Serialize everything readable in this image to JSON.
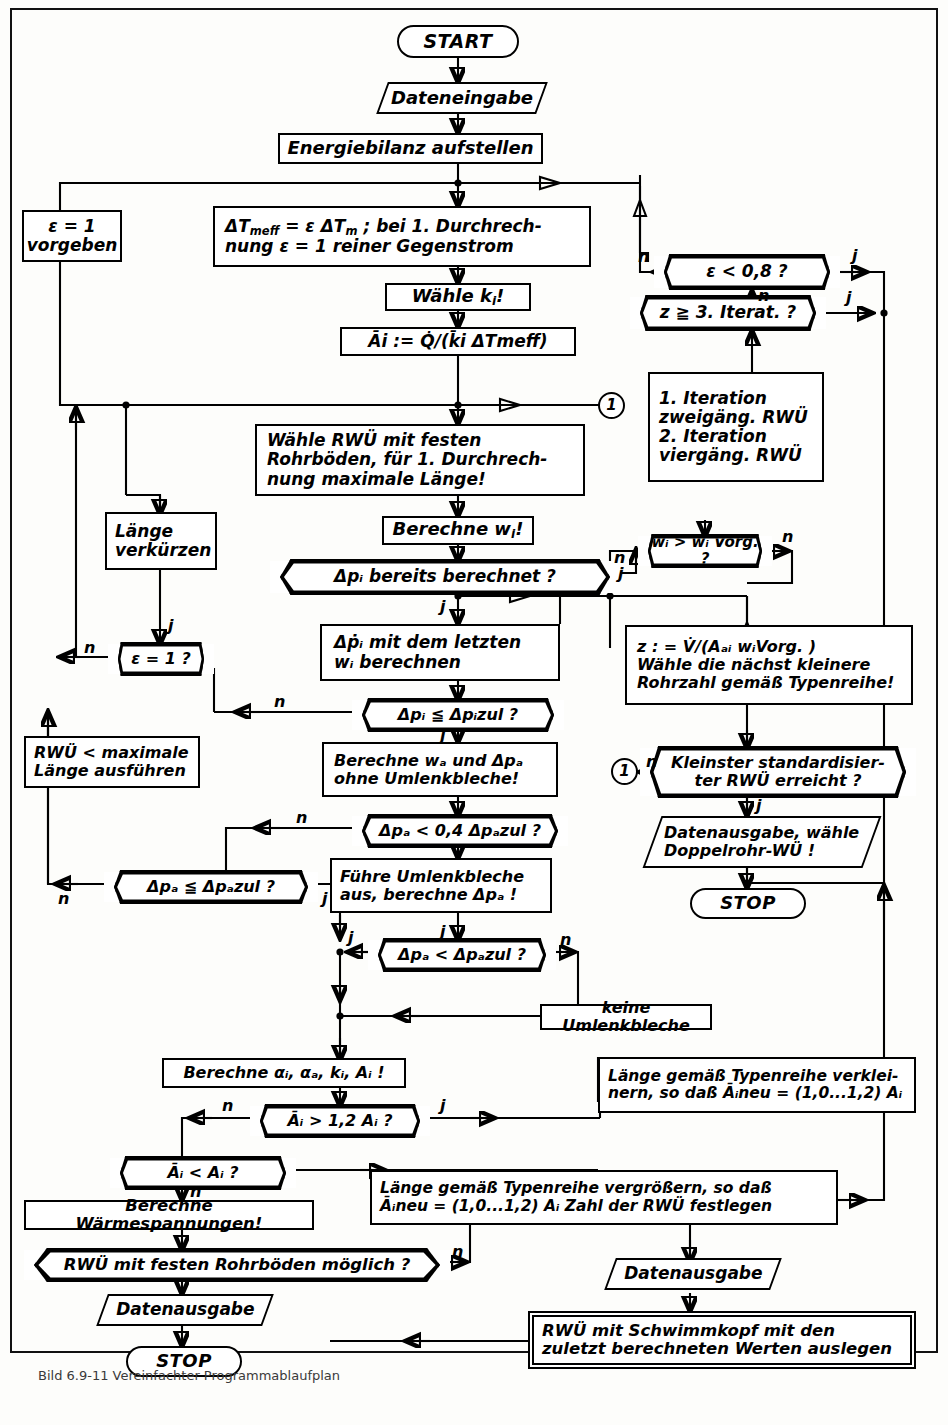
{
  "diagram": {
    "type": "flowchart",
    "language": "de",
    "colors": {
      "ink": "#000000",
      "paper": "#fdfdfb",
      "frame": "#111111"
    },
    "branch_labels": {
      "yes": "j",
      "no": "n"
    }
  },
  "nodes": {
    "start": {
      "label": "START",
      "shape": "terminator"
    },
    "dateneingabe": {
      "label": "Dateneingabe",
      "shape": "io"
    },
    "energiebilanz": {
      "label": "Energiebilanz aufstellen",
      "shape": "process"
    },
    "eps_vorgeben": {
      "line1": "ε = 1",
      "line2": "vorgeben",
      "shape": "process"
    },
    "dtmeff": {
      "line1": "ΔT",
      "sub1": "meff",
      "rest1": " = ε ΔT",
      "sub2": "m",
      "rest2": " ; bei 1. Durchrech-",
      "line2": "nung ε = 1 reiner Gegenstrom",
      "shape": "process"
    },
    "waehle_ki": {
      "label": "Wähle k",
      "sub": "i",
      "suffix": "!",
      "shape": "process"
    },
    "ai_def": {
      "label": "A",
      "shape": "process",
      "text": "Āi := Q̇/(k̄i ΔTmeff)"
    },
    "eps_klein": {
      "label": "ε < 0,8 ?",
      "shape": "decision"
    },
    "z_iterat": {
      "label": "z ≧ 3. Iterat. ?",
      "shape": "decision"
    },
    "iterationen": {
      "l1": "1. Iteration",
      "l2": "zweigäng. RWÜ",
      "l3": "2. Iteration",
      "l4": "viergäng. RWÜ",
      "shape": "process"
    },
    "waehle_rwue": {
      "l1": "Wähle RWÜ mit festen",
      "l2": "Rohrböden, für 1. Durchrech-",
      "l3": "nung maximale Länge!",
      "shape": "process"
    },
    "laenge_verkuerzen": {
      "l1": "Länge",
      "l2": "verkürzen",
      "shape": "process"
    },
    "berechne_wi": {
      "label": "Berechne w",
      "sub": "i",
      "suffix": "!",
      "shape": "process"
    },
    "dpi_berechnet": {
      "label": "Δpᵢ bereits berechnet ?",
      "shape": "decision"
    },
    "wi_vorg": {
      "label": "wᵢ > wᵢ Vorg. ?",
      "shape": "decision"
    },
    "dpi_letzten": {
      "l1": "Δṗᵢ mit dem letzten",
      "l2": "wᵢ berechnen",
      "shape": "process"
    },
    "eps_ist_1": {
      "label": "ε = 1 ?",
      "shape": "decision"
    },
    "dpi_zul": {
      "label": "Δpᵢ ≦ Δpᵢzul ?",
      "shape": "decision"
    },
    "rwue_max": {
      "l1": "RWÜ < maximale",
      "l2": "Länge ausführen",
      "shape": "process"
    },
    "berechne_wa": {
      "l1": "Berechne wₐ und Δpₐ",
      "l2": "ohne Umlenkbleche!",
      "shape": "process"
    },
    "dpa_04": {
      "label": "Δpₐ < 0,4 Δpₐzul ?",
      "shape": "decision"
    },
    "dpa_zul_le": {
      "label": "Δpₐ ≦ Δpₐzul ?",
      "shape": "decision"
    },
    "fuehre_umlenk": {
      "l1": "Führe Umlenkbleche",
      "l2": "aus, berechne Δpₐ !",
      "shape": "process"
    },
    "dpa_lt": {
      "label": "Δpₐ < Δpₐzul ?",
      "shape": "decision"
    },
    "keine_umlenk": {
      "label": "keine Umlenkbleche",
      "shape": "process"
    },
    "z_def": {
      "l1": "z : = V̇/(Aₐᵢ wᵢVorg. )",
      "l2": "Wähle die nächst kleinere",
      "l3": "Rohrzahl gemäß Typenreihe!",
      "shape": "process"
    },
    "kleinster_rwue": {
      "l1": "Kleinster standardisier-",
      "l2": "ter RWÜ erreicht ?",
      "shape": "decision"
    },
    "datenausgabe_doppelrohr": {
      "l1": "Datenausgabe, wähle",
      "l2": "Doppelrohr-WÜ !",
      "shape": "io"
    },
    "stop_right": {
      "label": "STOP",
      "shape": "terminator"
    },
    "berechne_alpha": {
      "label": "Berechne αᵢ, αₐ, kᵢ, Aᵢ !",
      "shape": "process"
    },
    "ai_gt": {
      "label": "Āᵢ > 1,2 Aᵢ ?",
      "shape": "decision"
    },
    "ai_lt": {
      "label": "Āᵢ < Aᵢ ?",
      "shape": "decision"
    },
    "laenge_verkleinern": {
      "l1": "Länge gemäß Typenreihe verklei-",
      "l2": "nern, so daß Āᵢneu = (1,0...1,2) Aᵢ",
      "shape": "process"
    },
    "laenge_vergroessern": {
      "l1": "Länge gemäß Typenreihe vergrößern, so daß",
      "l2": "Āᵢneu = (1,0...1,2) Aᵢ Zahl der RWÜ festlegen",
      "shape": "process"
    },
    "waermespannungen": {
      "label": "Berechne Wärmespannungen!",
      "shape": "process"
    },
    "feste_rohrboeden": {
      "label": "RWÜ mit festen Rohrböden möglich ?",
      "shape": "decision"
    },
    "datenausgabe_2": {
      "label": "Datenausgabe",
      "shape": "io"
    },
    "datenausgabe_3": {
      "label": "Datenausgabe",
      "shape": "io"
    },
    "schwimmkopf": {
      "l1": "RWÜ mit Schwimmkopf mit den",
      "l2": "zuletzt berechneten Werten auslegen",
      "shape": "process-double"
    },
    "stop_bottom": {
      "label": "STOP",
      "shape": "terminator"
    },
    "connector_1_left": {
      "label": "1",
      "shape": "connector"
    },
    "connector_1_right": {
      "label": "1",
      "shape": "connector"
    }
  },
  "edge_labels": [
    {
      "id": "eps08-n",
      "text": "n"
    },
    {
      "id": "eps08-j",
      "text": "j"
    },
    {
      "id": "z-n",
      "text": "n"
    },
    {
      "id": "z-j",
      "text": "j"
    },
    {
      "id": "dpi-n",
      "text": "n"
    },
    {
      "id": "dpi-j",
      "text": "j"
    },
    {
      "id": "wi-n",
      "text": "n"
    },
    {
      "id": "wi-j",
      "text": "j"
    },
    {
      "id": "eps1-j",
      "text": "j"
    },
    {
      "id": "eps1-n",
      "text": "n"
    },
    {
      "id": "dpizul-n",
      "text": "n"
    },
    {
      "id": "dpizul-j",
      "text": "j"
    },
    {
      "id": "dpa04-n",
      "text": "n"
    },
    {
      "id": "dpaz-n",
      "text": "n"
    },
    {
      "id": "dpaz-j",
      "text": "j"
    },
    {
      "id": "dpalt-j-left",
      "text": "j"
    },
    {
      "id": "dpalt-j-top",
      "text": "j"
    },
    {
      "id": "dpalt-n",
      "text": "n"
    },
    {
      "id": "kleinst-n",
      "text": "n"
    },
    {
      "id": "kleinst-j",
      "text": "j"
    },
    {
      "id": "aigt-n",
      "text": "n"
    },
    {
      "id": "aigt-j",
      "text": "j"
    },
    {
      "id": "ailt-n",
      "text": "n"
    },
    {
      "id": "feste-n",
      "text": "n"
    }
  ],
  "caption": {
    "text": "Bild 6.9-11  Vereinfachter Programmablaufplan"
  }
}
